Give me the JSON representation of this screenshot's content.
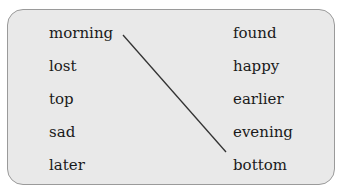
{
  "exercise": {
    "left_column": [
      "morning",
      "lost",
      "top",
      "sad",
      "later"
    ],
    "right_column": [
      "found",
      "happy",
      "earlier",
      "evening",
      "bottom"
    ],
    "connections": [
      {
        "from": "morning",
        "to": "evening"
      }
    ],
    "colors": {
      "panel_bg": "#e9e9e9",
      "border": "#9a9a9a",
      "line": "#333333",
      "text": "#1a1a1a"
    }
  }
}
